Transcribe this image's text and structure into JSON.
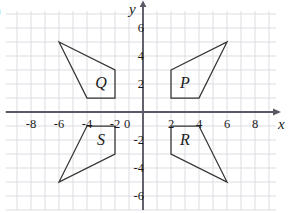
{
  "figure": {
    "corner_mark": ")",
    "axes": {
      "x_label": "x",
      "y_label": "y",
      "x_ticks": [
        "-8",
        "-6",
        "-4",
        "-2",
        "2",
        "4",
        "6",
        "8"
      ],
      "x_tick_values": [
        -8,
        -6,
        -4,
        -2,
        2,
        4,
        6,
        8
      ],
      "y_ticks": [
        "6",
        "4",
        "2",
        "-2",
        "-4",
        "-6"
      ],
      "y_tick_values": [
        6,
        4,
        2,
        -2,
        -4,
        -6
      ],
      "origin_label": "0",
      "x_range": [
        -9.8,
        9.5
      ],
      "y_range": [
        -7.0,
        7.2
      ],
      "grid": true,
      "grid_step": 1,
      "axis_color": "#5a5a66",
      "grid_color": "#d9d9e0"
    },
    "shapes": [
      {
        "label": "P",
        "label_at": [
          3.0,
          2.1
        ],
        "stroke": "#333333",
        "vertices": [
          [
            2,
            3
          ],
          [
            6,
            5
          ],
          [
            4,
            1
          ],
          [
            2,
            1
          ]
        ]
      },
      {
        "label": "Q",
        "label_at": [
          -3.0,
          2.1
        ],
        "stroke": "#333333",
        "vertices": [
          [
            -6,
            5
          ],
          [
            -2,
            3
          ],
          [
            -2,
            1
          ],
          [
            -4,
            1
          ]
        ]
      },
      {
        "label": "R",
        "label_at": [
          3.0,
          -2.0
        ],
        "stroke": "#333333",
        "vertices": [
          [
            2,
            -1
          ],
          [
            4,
            -1
          ],
          [
            6,
            -5
          ],
          [
            2,
            -3
          ]
        ]
      },
      {
        "label": "S",
        "label_at": [
          -3.0,
          -2.0
        ],
        "stroke": "#333333",
        "vertices": [
          [
            -4,
            -1
          ],
          [
            -2,
            -1
          ],
          [
            -2,
            -3
          ],
          [
            -6,
            -5
          ]
        ]
      }
    ]
  }
}
